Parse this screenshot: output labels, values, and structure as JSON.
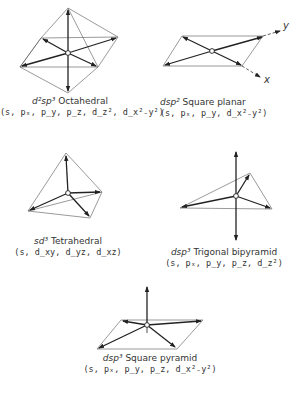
{
  "figure": {
    "structures": [
      {
        "id": "octahedral",
        "hybrid": "d²sp³",
        "hybrid_prefix": "d",
        "hybrid_sup1": "2",
        "hybrid_mid": "sp",
        "hybrid_sup2": "3",
        "geometry": "Octahedral",
        "orbitals": "(s, pₓ, p_y, p_z, d_z², d_x²₋y²)"
      },
      {
        "id": "square-planar",
        "hybrid": "dsp²",
        "hybrid_prefix": "dsp",
        "hybrid_sup1": "2",
        "geometry": "Square planar",
        "orbitals": "(s, pₓ, p_y, d_x²₋y²)"
      },
      {
        "id": "tetrahedral",
        "hybrid": "sd³",
        "hybrid_prefix": "sd",
        "hybrid_sup1": "3",
        "geometry": "Tetrahedral",
        "orbitals": "(s, d_xy, d_yz, d_xz)"
      },
      {
        "id": "trigonal-bipyramid",
        "hybrid": "dsp³",
        "hybrid_prefix": "dsp",
        "hybrid_sup1": "3",
        "geometry": "Trigonal bipyramid",
        "orbitals": "(s, pₓ, p_y, p_z, d_z²)"
      },
      {
        "id": "square-pyramid",
        "hybrid": "dsp³",
        "hybrid_prefix": "dsp",
        "hybrid_sup1": "3",
        "geometry": "Square pyramid",
        "orbitals": "(s, pₓ, p_y, p_z, d_x²₋y²)"
      }
    ],
    "axes": {
      "x_label": "x",
      "y_label": "y"
    },
    "colors": {
      "line": "#333333",
      "arrow": "#222222",
      "background": "#ffffff"
    }
  }
}
